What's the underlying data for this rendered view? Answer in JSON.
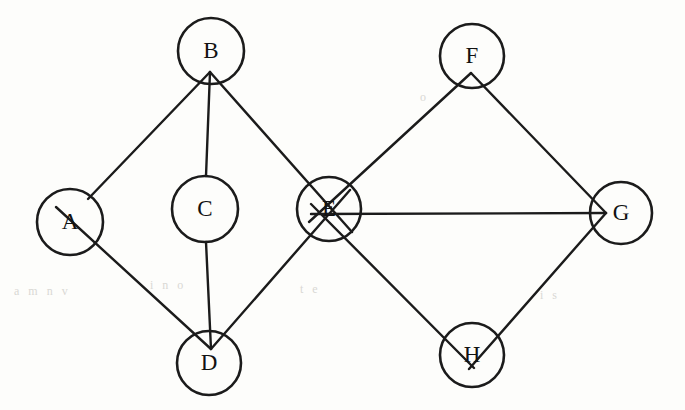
{
  "diagram": {
    "type": "undirected-graph",
    "background_color": "#fdfdfb",
    "stroke_color": "#1b1b1b",
    "label_color": "#121212",
    "nodes": [
      {
        "id": "A",
        "label": "A",
        "cx": 70,
        "cy": 222,
        "r": 33
      },
      {
        "id": "B",
        "label": "B",
        "cx": 211,
        "cy": 51,
        "r": 33
      },
      {
        "id": "C",
        "label": "C",
        "cx": 205,
        "cy": 209,
        "r": 33
      },
      {
        "id": "D",
        "label": "D",
        "cx": 209,
        "cy": 363,
        "r": 32
      },
      {
        "id": "E",
        "label": "E",
        "cx": 329,
        "cy": 209,
        "r": 32
      },
      {
        "id": "F",
        "label": "F",
        "cx": 472,
        "cy": 56,
        "r": 32
      },
      {
        "id": "G",
        "label": "G",
        "cx": 621,
        "cy": 213,
        "r": 31
      },
      {
        "id": "H",
        "label": "H",
        "cx": 472,
        "cy": 355,
        "r": 32
      }
    ],
    "edges": [
      {
        "id": "A-B",
        "from": "A",
        "to": "B",
        "x1": 88,
        "y1": 199,
        "x2": 210,
        "y2": 72
      },
      {
        "id": "B-C",
        "from": "B",
        "to": "C",
        "x1": 210,
        "y1": 72,
        "x2": 206,
        "y2": 176
      },
      {
        "id": "B-E",
        "from": "B",
        "to": "E",
        "x1": 210,
        "y1": 72,
        "x2": 352,
        "y2": 232
      },
      {
        "id": "A-D",
        "from": "A",
        "to": "D",
        "x1": 56,
        "y1": 207,
        "x2": 211,
        "y2": 349
      },
      {
        "id": "C-D",
        "from": "C",
        "to": "D",
        "x1": 206,
        "y1": 242,
        "x2": 211,
        "y2": 349
      },
      {
        "id": "D-E",
        "from": "D",
        "to": "E",
        "x1": 211,
        "y1": 349,
        "x2": 350,
        "y2": 190
      },
      {
        "id": "E-F",
        "from": "E",
        "to": "F",
        "x1": 309,
        "y1": 222,
        "x2": 471,
        "y2": 73
      },
      {
        "id": "E-G",
        "from": "E",
        "to": "G",
        "x1": 311,
        "y1": 214,
        "x2": 606,
        "y2": 213
      },
      {
        "id": "E-H",
        "from": "E",
        "to": "H",
        "x1": 311,
        "y1": 204,
        "x2": 474,
        "y2": 368
      },
      {
        "id": "F-G",
        "from": "F",
        "to": "G",
        "x1": 471,
        "y1": 73,
        "x2": 606,
        "y2": 213
      },
      {
        "id": "G-H",
        "from": "G",
        "to": "H",
        "x1": 606,
        "y1": 213,
        "x2": 469,
        "y2": 369
      }
    ],
    "node_count": 8,
    "edge_count": 11,
    "ghost_marks": [
      {
        "text": "a   m n v",
        "x": 14,
        "y": 292
      },
      {
        "text": "i  n  o",
        "x": 150,
        "y": 286
      },
      {
        "text": "t e",
        "x": 300,
        "y": 290
      },
      {
        "text": "i s",
        "x": 540,
        "y": 296
      },
      {
        "text": "o",
        "x": 420,
        "y": 98
      }
    ]
  }
}
